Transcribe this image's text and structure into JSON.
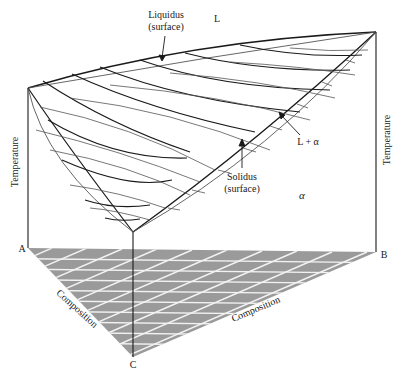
{
  "diagram": {
    "type": "ternary-isomorphous-phase-diagram-3d",
    "colors": {
      "line_dark": "#1a1a1a",
      "line_light": "#555555",
      "floor_fill": "#9a9a9a",
      "floor_grid": "#f2f2f2"
    },
    "labels": {
      "liquidus_line1": "Liquidus",
      "liquidus_line2": "(surface)",
      "liquid_phase": "L",
      "two_phase": "L + α",
      "solidus_line1": "Solidus",
      "solidus_line2": "(surface)",
      "solid_phase": "α",
      "temperature_left": "Temperature",
      "temperature_right": "Temperature",
      "vertex_a": "A",
      "vertex_b": "B",
      "vertex_c": "C",
      "composition_ac": "Composition",
      "composition_cb": "Composition"
    },
    "vertices": {
      "A_top": [
        28,
        88
      ],
      "A_base": [
        28,
        248
      ],
      "B_top": [
        376,
        32
      ],
      "B_base": [
        376,
        252
      ],
      "C_top": [
        133,
        232
      ],
      "C_base": [
        133,
        357
      ]
    }
  }
}
